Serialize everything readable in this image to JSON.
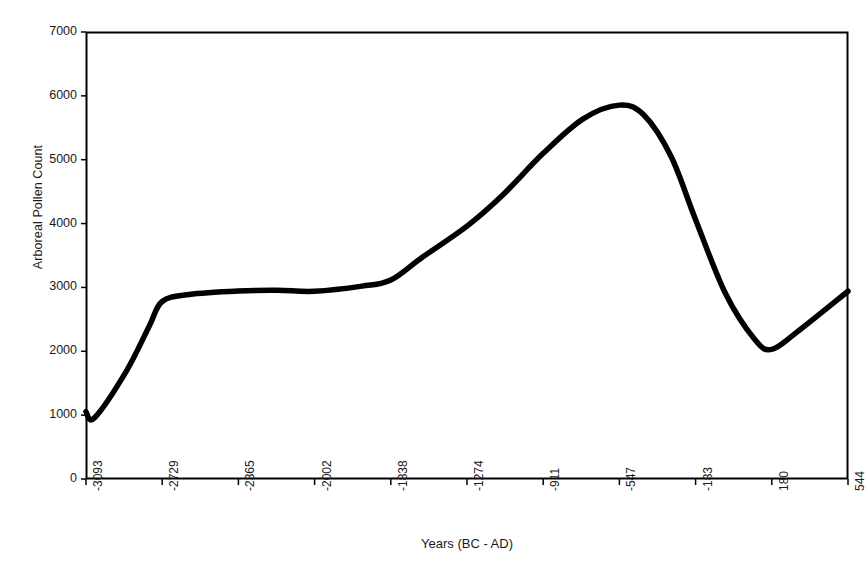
{
  "chart_data": {
    "type": "line",
    "title": "",
    "xlabel": "Years (BC - AD)",
    "ylabel": "Arboreal Pollen Count",
    "grid": false,
    "legend": false,
    "legend_position": "none",
    "ylim": [
      0,
      7000
    ],
    "y_ticks": [
      0,
      1000,
      2000,
      3000,
      4000,
      5000,
      6000,
      7000
    ],
    "y_tick_labels": [
      "0",
      "1000",
      "2000",
      "3000",
      "4000",
      "5000",
      "6000",
      "7000"
    ],
    "x_tick_labels": [
      "-3093",
      "-2729",
      "-2365",
      "-2002",
      "-1838",
      "-1274",
      "-911",
      "-547",
      "-183",
      "180",
      "544"
    ],
    "categories": [
      "-3093",
      "-2729",
      "-2365",
      "-2002",
      "-1838",
      "-1274",
      "-911",
      "-547",
      "-183",
      "180",
      "544"
    ],
    "series": [
      {
        "name": "Arboreal Pollen Count",
        "color": "#000000",
        "values": [
          1050,
          2780,
          2945,
          2960,
          3110,
          3960,
          5300,
          5850,
          4050,
          2080,
          2940
        ]
      }
    ],
    "points": [
      {
        "x": "-3093",
        "y": 1055
      },
      {
        "x": "-3052",
        "y": 960
      },
      {
        "x": "-2900",
        "y": 1690
      },
      {
        "x": "-2790",
        "y": 2400
      },
      {
        "x": "-2729",
        "y": 2780
      },
      {
        "x": "-2600",
        "y": 2890
      },
      {
        "x": "-2365",
        "y": 2945
      },
      {
        "x": "-2180",
        "y": 2955
      },
      {
        "x": "-2002",
        "y": 2940
      },
      {
        "x": "-1900",
        "y": 3020
      },
      {
        "x": "-1838",
        "y": 3115
      },
      {
        "x": "-1600",
        "y": 3480
      },
      {
        "x": "-1274",
        "y": 3960
      },
      {
        "x": "-1100",
        "y": 4460
      },
      {
        "x": "-911",
        "y": 5100
      },
      {
        "x": "-720",
        "y": 5640
      },
      {
        "x": "-547",
        "y": 5855
      },
      {
        "x": "-430",
        "y": 5700
      },
      {
        "x": "-300",
        "y": 5050
      },
      {
        "x": "-183",
        "y": 4060
      },
      {
        "x": "-40",
        "y": 2900
      },
      {
        "x": "100",
        "y": 2180
      },
      {
        "x": "180",
        "y": 2030
      },
      {
        "x": "300",
        "y": 2300
      },
      {
        "x": "544",
        "y": 2940
      }
    ],
    "annotations": []
  },
  "axes": {
    "y_title": "Arboreal Pollen Count",
    "x_title": "Years (BC - AD)"
  }
}
